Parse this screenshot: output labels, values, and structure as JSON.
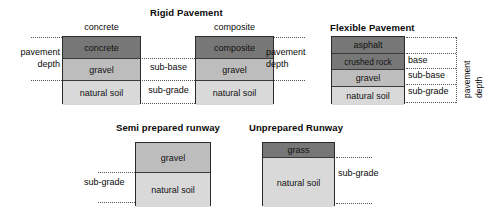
{
  "diagram": {
    "colors": {
      "surface_dark": "#777777",
      "layer_mid": "#bdbdbd",
      "layer_light": "#d9d9d9",
      "outline": "#2b2b2b",
      "guide_line": "#555555"
    },
    "sections": [
      {
        "id": "rigid-pavement",
        "title": "Rigid Pavement",
        "stacks": [
          {
            "id": "concrete-stack",
            "caption": "concrete",
            "layers": [
              {
                "label": "concrete",
                "tone": "dark"
              },
              {
                "label": "gravel",
                "tone": "mid"
              },
              {
                "label": "natural soil",
                "tone": "light"
              }
            ],
            "left_labels": [
              "pavement",
              "depth"
            ],
            "right_labels": [
              "sub-base",
              "sub-grade"
            ]
          },
          {
            "id": "composite-stack",
            "caption": "composite",
            "layers": [
              {
                "label": "composite",
                "tone": "dark"
              },
              {
                "label": "gravel",
                "tone": "mid"
              },
              {
                "label": "natural soil",
                "tone": "light"
              }
            ],
            "right_labels": [
              "pavement",
              "depth"
            ]
          }
        ]
      },
      {
        "id": "flexible-pavement",
        "title": "Flexible Pavement",
        "stacks": [
          {
            "id": "asphalt-stack",
            "layers": [
              {
                "label": "asphalt",
                "tone": "dark"
              },
              {
                "label": "crushed rock",
                "tone": "dark"
              },
              {
                "label": "gravel",
                "tone": "mid"
              },
              {
                "label": "natural soil",
                "tone": "light"
              }
            ],
            "right_labels": [
              "base",
              "sub-base",
              "sub-grade"
            ],
            "vertical_labels": [
              "pavement",
              "depth"
            ]
          }
        ]
      },
      {
        "id": "semi-prepared-runway",
        "title": "Semi prepared runway",
        "stacks": [
          {
            "id": "semi-prepared-stack",
            "layers": [
              {
                "label": "gravel",
                "tone": "mid"
              },
              {
                "label": "natural soil",
                "tone": "light"
              }
            ],
            "left_labels": [
              "sub-grade"
            ]
          }
        ]
      },
      {
        "id": "unprepared-runway",
        "title": "Unprepared Runway",
        "stacks": [
          {
            "id": "unprepared-stack",
            "layers": [
              {
                "label": "grass",
                "tone": "dark"
              },
              {
                "label": "natural soil",
                "tone": "light"
              }
            ],
            "right_labels": [
              "sub-grade"
            ]
          }
        ]
      }
    ]
  }
}
